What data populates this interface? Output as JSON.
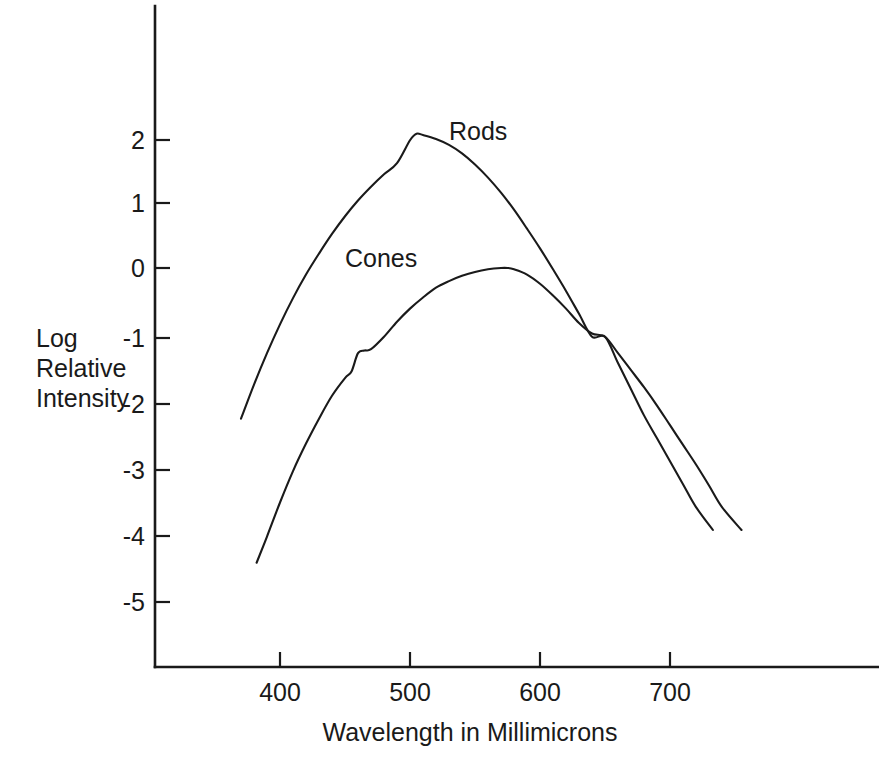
{
  "chart_data": {
    "type": "line",
    "title": "",
    "xlabel": "Wavelength in Millimicrons",
    "ylabel": "Log Relative Intensity",
    "ylabel_lines": [
      "Log",
      "Relative",
      "Intensity"
    ],
    "xlim": [
      330,
      790
    ],
    "ylim": [
      -5.6,
      2.8
    ],
    "xticks": [
      400,
      500,
      600,
      700
    ],
    "xtick_labels": [
      "400",
      "500",
      "600",
      "700"
    ],
    "yticks": [
      2,
      1,
      0,
      -1,
      -2,
      -3,
      -4,
      -5
    ],
    "ytick_labels": [
      "2",
      "1",
      "0",
      "-1",
      "-2",
      "-3",
      "-4",
      "-5"
    ],
    "grid": false,
    "legend_position": "inline-annotation",
    "line_color": "#1a1a1a",
    "series": [
      {
        "name": "Rods",
        "label_x": 530,
        "label_y": 1.95,
        "peak_x": 505,
        "peak_y": 2.05,
        "x": [
          370,
          380,
          390,
          400,
          410,
          420,
          430,
          440,
          450,
          460,
          470,
          480,
          490,
          500,
          505,
          510,
          520,
          530,
          540,
          550,
          560,
          570,
          580,
          590,
          600,
          610,
          620,
          630,
          640,
          650,
          660,
          670,
          680,
          690,
          700,
          710,
          720,
          733
        ],
        "values": [
          -2.3,
          -1.78,
          -1.3,
          -0.86,
          -0.46,
          -0.1,
          0.22,
          0.52,
          0.79,
          1.03,
          1.24,
          1.43,
          1.6,
          1.95,
          2.05,
          2.03,
          1.97,
          1.88,
          1.75,
          1.58,
          1.38,
          1.15,
          0.89,
          0.6,
          0.3,
          -0.02,
          -0.35,
          -0.7,
          -1.05,
          -1.05,
          -1.45,
          -1.85,
          -2.25,
          -2.6,
          -2.95,
          -3.3,
          -3.65,
          -4.0
        ]
      },
      {
        "name": "Cones",
        "label_x": 450,
        "label_y": 0.02,
        "peak_x": 575,
        "peak_y": 0.0,
        "x": [
          382,
          390,
          400,
          410,
          420,
          430,
          440,
          450,
          455,
          460,
          465,
          470,
          480,
          490,
          500,
          510,
          520,
          530,
          540,
          550,
          560,
          570,
          575,
          580,
          590,
          600,
          610,
          620,
          630,
          640,
          650,
          660,
          670,
          680,
          690,
          700,
          710,
          720,
          730,
          740,
          755
        ],
        "values": [
          -4.5,
          -4.1,
          -3.58,
          -3.1,
          -2.68,
          -2.3,
          -1.95,
          -1.68,
          -1.58,
          -1.3,
          -1.26,
          -1.24,
          -1.05,
          -0.82,
          -0.62,
          -0.45,
          -0.3,
          -0.2,
          -0.12,
          -0.06,
          -0.02,
          0.0,
          0.0,
          -0.02,
          -0.1,
          -0.24,
          -0.42,
          -0.62,
          -0.84,
          -1.0,
          -1.05,
          -1.3,
          -1.56,
          -1.82,
          -2.1,
          -2.4,
          -2.7,
          -3.0,
          -3.32,
          -3.65,
          -4.0
        ]
      }
    ],
    "annotations": [
      {
        "text": "Rods",
        "x": 530,
        "y": 1.95
      },
      {
        "text": "Cones",
        "x": 450,
        "y": 0.02
      }
    ],
    "crossing_point": {
      "x": 650,
      "y": -1.05
    }
  },
  "axes": {
    "x_axis_name": "wavelength-axis",
    "y_axis_name": "log-relative-intensity-axis"
  }
}
